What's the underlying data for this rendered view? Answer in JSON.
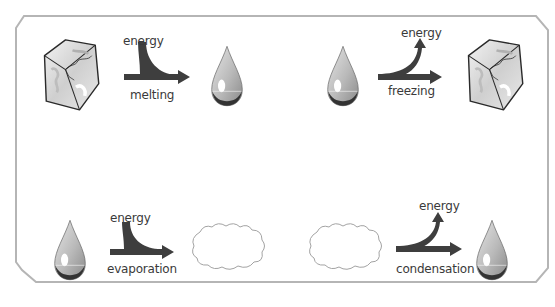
{
  "diagram": {
    "type": "phase-change-energy-diagram",
    "colors": {
      "frame_border": "#b5b5b5",
      "arrow": "#3e3e3e",
      "drop_fill": "#c8c8c8",
      "drop_shadow": "#3a3a3a",
      "cloud_stroke": "#9a9a9a",
      "ice_stroke": "#2a2a2a"
    },
    "processes": [
      {
        "id": "melting",
        "from": "ice-cube",
        "to": "water-drop",
        "energy_direction": "in",
        "energy_label": "energy",
        "process_label": "melting"
      },
      {
        "id": "freezing",
        "from": "water-drop",
        "to": "ice-cube",
        "energy_direction": "out",
        "energy_label": "energy",
        "process_label": "freezing"
      },
      {
        "id": "evaporation",
        "from": "water-drop",
        "to": "cloud",
        "energy_direction": "in",
        "energy_label": "energy",
        "process_label": "evaporation"
      },
      {
        "id": "condensation",
        "from": "cloud",
        "to": "water-drop",
        "energy_direction": "out",
        "energy_label": "energy",
        "process_label": "condensation"
      }
    ]
  }
}
